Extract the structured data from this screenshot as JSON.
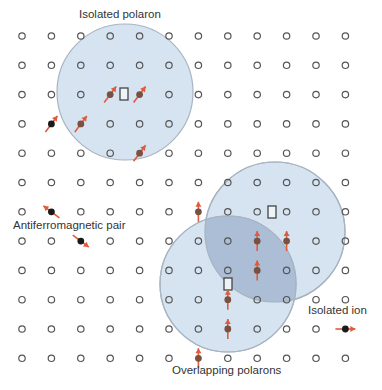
{
  "colors": {
    "background": "#ffffff",
    "site_stroke": "#555555",
    "polaron_fill": "#cfdff0",
    "polaron_stroke": "#a8b4c0",
    "overlap_fill": "#9fb3cc",
    "spin_arrow": "#e05a3c",
    "spin_dot_in_polaron": "#7a5040",
    "spin_dot_isolated": "#1a1a1a",
    "vacancy_stroke": "#444444"
  },
  "lattice": {
    "columns": 12,
    "rows": 12,
    "x0": 22,
    "y0": 36,
    "dx": 29.4,
    "dy": 29.3
  },
  "polarons": [
    {
      "name": "isolated-polaron",
      "cx": 125,
      "cy": 92,
      "r": 68
    },
    {
      "name": "overlapping-polaron-upper",
      "cx": 275,
      "cy": 232,
      "r": 70
    },
    {
      "name": "overlapping-polaron-lower",
      "cx": 228,
      "cy": 284,
      "r": 68
    }
  ],
  "vacancies": [
    {
      "x": 124,
      "y": 94
    },
    {
      "x": 272,
      "y": 212
    },
    {
      "x": 228,
      "y": 284
    }
  ],
  "spins": [
    {
      "col": 3,
      "row": 2,
      "dir": "ne",
      "kind": "polaron"
    },
    {
      "col": 4,
      "row": 2,
      "dir": "ne",
      "kind": "polaron"
    },
    {
      "col": 2,
      "row": 3,
      "dir": "ne",
      "kind": "polaron"
    },
    {
      "col": 4,
      "row": 4,
      "dir": "ne",
      "kind": "polaron"
    },
    {
      "col": 1,
      "row": 3,
      "dir": "ne",
      "kind": "isolated"
    },
    {
      "col": 1,
      "row": 6,
      "dir": "nw",
      "kind": "isolated"
    },
    {
      "col": 2,
      "row": 7,
      "dir": "se",
      "kind": "isolated"
    },
    {
      "col": 6,
      "row": 6,
      "dir": "n",
      "kind": "polaron"
    },
    {
      "col": 9,
      "row": 7,
      "dir": "n",
      "kind": "polaron"
    },
    {
      "col": 8,
      "row": 7,
      "dir": "n",
      "kind": "polaron",
      "offset_x": 0
    },
    {
      "col": 8,
      "row": 8,
      "dir": "n",
      "kind": "polaron"
    },
    {
      "col": 7,
      "row": 9,
      "dir": "n",
      "kind": "polaron"
    },
    {
      "col": 7,
      "row": 10,
      "dir": "n",
      "kind": "polaron"
    },
    {
      "col": 6,
      "row": 11,
      "dir": "n",
      "kind": "polaron"
    },
    {
      "col": 11,
      "row": 10,
      "dir": "e",
      "kind": "isolated"
    }
  ],
  "labels": {
    "isolated_polaron": "Isolated polaron",
    "antiferromagnetic_pair": "Antiferromagnetic pair",
    "isolated_ion": "Isolated ion",
    "overlapping_polarons": "Overlapping polarons"
  }
}
